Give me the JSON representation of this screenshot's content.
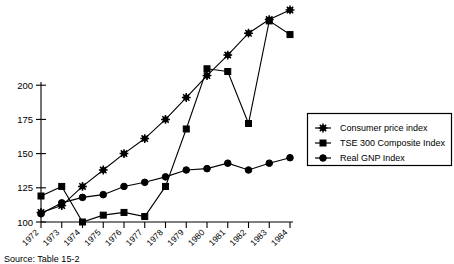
{
  "chart_data": {
    "type": "line",
    "title": "",
    "xlabel": "",
    "ylabel": "",
    "categories": [
      "1972",
      "1973",
      "1974",
      "1975",
      "1976",
      "1977",
      "1978",
      "1979",
      "1980",
      "1981",
      "1982",
      "1983",
      "1984"
    ],
    "xlim": [
      1972,
      1984
    ],
    "ylim": [
      100,
      260
    ],
    "yticks": [
      100,
      125,
      150,
      175,
      200
    ],
    "ytick_labels": [
      "100",
      "125",
      "150",
      "175",
      "200"
    ],
    "grid": false,
    "legend_position": "right",
    "series": [
      {
        "name": "Consumer price index",
        "marker": "star",
        "values": [
          107,
          112,
          126,
          138,
          150,
          161,
          175,
          191,
          207,
          222,
          238,
          248,
          255
        ]
      },
      {
        "name": "TSE 300 Composite Index",
        "marker": "square",
        "values": [
          119,
          126,
          100,
          105,
          107,
          104,
          126,
          168,
          212,
          210,
          172,
          247,
          237
        ]
      },
      {
        "name": "Real GNP Index",
        "marker": "circle",
        "values": [
          106,
          114,
          118,
          120,
          126,
          129,
          133,
          138,
          139,
          143,
          138,
          143,
          147
        ]
      }
    ]
  },
  "legend": {
    "items": [
      {
        "label": "Consumer price index",
        "marker": "star"
      },
      {
        "label": "TSE 300 Composite Index",
        "marker": "square"
      },
      {
        "label": "Real GNP Index",
        "marker": "circle"
      }
    ]
  },
  "footer": {
    "source": "Source: Table 15-2"
  },
  "colors": {
    "ink": "#000000",
    "background": "#ffffff"
  }
}
